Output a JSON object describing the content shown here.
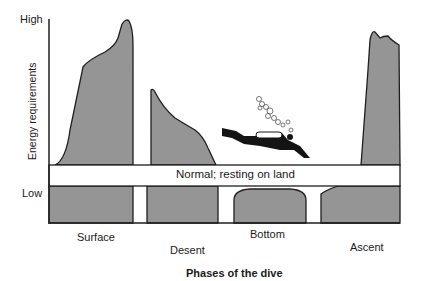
{
  "diagram": {
    "y_axis": {
      "label": "Energy requirements",
      "ticks": {
        "high": "High",
        "low": "Low"
      }
    },
    "x_axis": {
      "title": "Phases of the dive"
    },
    "baseline_band": {
      "label": "Normal; resting on land"
    },
    "phases": [
      {
        "name": "Surface",
        "energy_level": "high"
      },
      {
        "name": "Desent",
        "energy_level": "moderate, decreasing"
      },
      {
        "name": "Bottom",
        "energy_level": "low, below normal"
      },
      {
        "name": "Ascent",
        "energy_level": "high"
      }
    ],
    "illustration": "scuba-diver-with-bubbles",
    "colors": {
      "fill": "#959595",
      "stroke": "#1e1e1e",
      "band": "#ffffff"
    }
  }
}
